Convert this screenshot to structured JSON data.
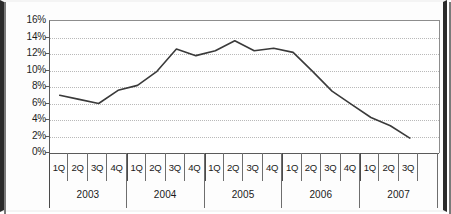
{
  "chart_data": {
    "type": "line",
    "title": "",
    "subtitle": "",
    "xlabel": "",
    "ylabel": "",
    "grid": true,
    "legend": "none",
    "ylim": [
      0,
      16
    ],
    "ytick_labels": [
      "16%",
      "14%",
      "12%",
      "10%",
      "8%",
      "6%",
      "4%",
      "2%",
      "0%"
    ],
    "ytick_values": [
      16,
      14,
      12,
      10,
      8,
      6,
      4,
      2,
      0
    ],
    "categories": [
      "1Q 2003",
      "2Q 2003",
      "3Q 2003",
      "4Q 2003",
      "1Q 2004",
      "2Q 2004",
      "3Q 2004",
      "4Q 2004",
      "1Q 2005",
      "2Q 2005",
      "3Q 2005",
      "4Q 2005",
      "1Q 2006",
      "2Q 2006",
      "3Q 2006",
      "4Q 2006",
      "1Q 2007",
      "2Q 2007",
      "3Q 2007"
    ],
    "values": [
      7.0,
      6.5,
      6.0,
      7.6,
      8.2,
      9.9,
      12.6,
      11.8,
      12.4,
      13.6,
      12.4,
      12.7,
      12.2,
      9.9,
      7.5,
      5.9,
      4.3,
      3.3,
      1.8
    ],
    "series": [
      {
        "name": "series-1",
        "color": "#3a3a3a",
        "values": [
          7.0,
          6.5,
          6.0,
          7.6,
          8.2,
          9.9,
          12.6,
          11.8,
          12.4,
          13.6,
          12.4,
          12.7,
          12.2,
          9.9,
          7.5,
          5.9,
          4.3,
          3.3,
          1.8
        ]
      }
    ]
  },
  "axis": {
    "quarter_labels": [
      "1Q",
      "2Q",
      "3Q",
      "4Q",
      "1Q",
      "2Q",
      "3Q",
      "4Q",
      "1Q",
      "2Q",
      "3Q",
      "4Q",
      "1Q",
      "2Q",
      "3Q",
      "4Q",
      "1Q",
      "2Q",
      "3Q",
      ""
    ],
    "year_labels": [
      "2003",
      "2004",
      "2005",
      "2006",
      "2007"
    ]
  },
  "style": {
    "line_color": "#3a3a3a",
    "grid_color": "#b9b9b9",
    "axis_color": "#5a5a5a",
    "text_color": "#1a1a1a",
    "plot_background": "#ffffff",
    "page_background": "#fdfdfd",
    "border_color": "#2b2b2b"
  }
}
